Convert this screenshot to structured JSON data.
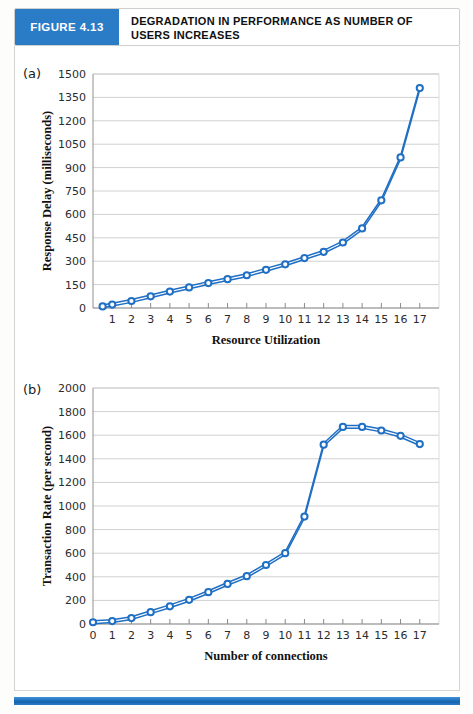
{
  "header": {
    "figure_number": "FIGURE 4.13",
    "title": "DEGRADATION IN PERFORMANCE AS NUMBER OF USERS INCREASES"
  },
  "panels": {
    "a_letter": "(a)",
    "b_letter": "(b)"
  },
  "colors": {
    "accent_blue": "#2a7cc7",
    "series_blue": "#1f6fc4",
    "marker_fill": "#ffffff",
    "gridline": "#d0d0d0",
    "axis": "#808080",
    "text": "#1a1a1a"
  },
  "chart_data": [
    {
      "type": "line",
      "title": "(a)",
      "xlabel": "Resource Utilization",
      "ylabel": "Response Delay (milliseconds)",
      "xlim": [
        0,
        18
      ],
      "ylim": [
        0,
        1500
      ],
      "grid": true,
      "legend": "none",
      "xticks": [
        1,
        2,
        3,
        4,
        5,
        6,
        7,
        8,
        9,
        10,
        11,
        12,
        13,
        14,
        15,
        16,
        17
      ],
      "yticks": [
        0,
        150,
        300,
        450,
        600,
        750,
        900,
        1050,
        1200,
        1350,
        1500
      ],
      "x": [
        0.5,
        1,
        2,
        3,
        4,
        5,
        6,
        7,
        8,
        9,
        10,
        11,
        12,
        13,
        14,
        15,
        16,
        17
      ],
      "values": [
        10,
        20,
        38,
        65,
        98,
        128,
        152,
        180,
        198,
        230,
        258,
        295,
        330,
        365,
        415,
        485,
        620,
        960,
        1410
      ],
      "series": [
        {
          "name": "Response delay",
          "x": [
            0.5,
            1,
            2,
            3,
            4,
            5,
            6,
            7,
            8,
            9,
            10,
            11,
            12,
            13,
            14,
            15,
            16,
            17
          ],
          "values": [
            10,
            22,
            45,
            75,
            105,
            132,
            160,
            185,
            210,
            245,
            280,
            320,
            360,
            420,
            510,
            690,
            965,
            1410
          ]
        }
      ]
    },
    {
      "type": "line",
      "title": "(b)",
      "xlabel": "Number of connections",
      "ylabel": "Transaction Rate (per second)",
      "xlim": [
        0,
        18
      ],
      "ylim": [
        0,
        2000
      ],
      "grid": true,
      "legend": "none",
      "xticks": [
        0,
        1,
        2,
        3,
        4,
        5,
        6,
        7,
        8,
        9,
        10,
        11,
        12,
        13,
        14,
        15,
        16,
        17
      ],
      "yticks": [
        0,
        200,
        400,
        600,
        800,
        1000,
        1200,
        1400,
        1600,
        1800,
        2000
      ],
      "series": [
        {
          "name": "Transaction rate",
          "x": [
            0,
            1,
            2,
            3,
            4,
            5,
            6,
            7,
            8,
            9,
            10,
            11,
            12,
            13,
            14,
            15,
            16,
            17
          ],
          "values": [
            15,
            25,
            50,
            100,
            150,
            205,
            270,
            340,
            405,
            500,
            600,
            910,
            1520,
            1670,
            1670,
            1640,
            1595,
            1525,
            1450
          ]
        }
      ]
    }
  ]
}
